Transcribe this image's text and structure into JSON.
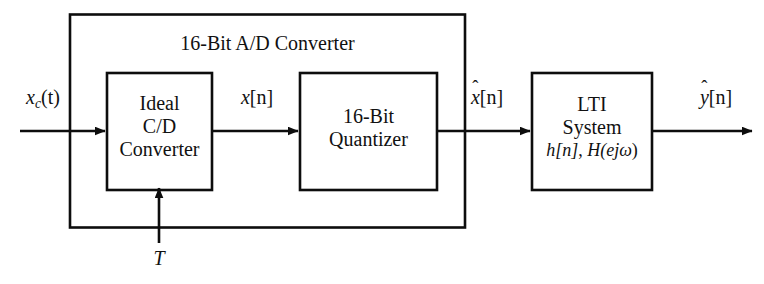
{
  "figure": {
    "type": "block-diagram",
    "title_text": "16-Bit A/D Converter",
    "background_color": "#ffffff",
    "line_color": "#0d0d0d"
  },
  "blocks": {
    "cd_converter": {
      "line1": "Ideal",
      "line2": "C/D",
      "line3": "Converter"
    },
    "quantizer": {
      "line1": "16-Bit",
      "line2": "Quantizer"
    },
    "lti": {
      "line1": "LTI",
      "line2": "System",
      "line3_h": "h[n]",
      "line3_sep": ", ",
      "line3_H": "H(e",
      "line3_exp": "jω",
      "line3_close": ")"
    }
  },
  "signals": {
    "input_continuous": {
      "base": "x",
      "sub": "c",
      "arg": "(t)"
    },
    "after_cd": {
      "base": "x",
      "brackets": "[n]"
    },
    "after_quantizer": {
      "hat": "ˆ",
      "base": "x",
      "brackets": "[n]"
    },
    "output": {
      "hat": "ˆ",
      "base": "y",
      "brackets": "[n]"
    },
    "sampling_period": "T"
  }
}
